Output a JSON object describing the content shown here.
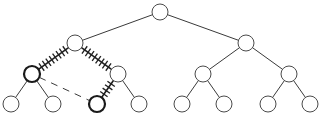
{
  "diagram": {
    "type": "binary-tree",
    "depth": 3,
    "node_radius": 8,
    "colors": {
      "background": "#ffffff",
      "node_stroke": "#4a4a4a",
      "highlight_stroke": "#1a1a1a",
      "edge": "#3a3a3a"
    },
    "nodes": [
      {
        "id": "n0",
        "level": 0,
        "x": 160,
        "y": 12,
        "highlight": false
      },
      {
        "id": "n1",
        "level": 1,
        "x": 75,
        "y": 43,
        "highlight": false
      },
      {
        "id": "n2",
        "level": 1,
        "x": 246,
        "y": 43,
        "highlight": false
      },
      {
        "id": "n3",
        "level": 2,
        "x": 32,
        "y": 74,
        "highlight": true
      },
      {
        "id": "n4",
        "level": 2,
        "x": 118,
        "y": 74,
        "highlight": false
      },
      {
        "id": "n5",
        "level": 2,
        "x": 203,
        "y": 74,
        "highlight": false
      },
      {
        "id": "n6",
        "level": 2,
        "x": 289,
        "y": 74,
        "highlight": false
      },
      {
        "id": "n7",
        "level": 3,
        "x": 11,
        "y": 104,
        "highlight": false
      },
      {
        "id": "n8",
        "level": 3,
        "x": 53,
        "y": 104,
        "highlight": false
      },
      {
        "id": "n9",
        "level": 3,
        "x": 97,
        "y": 104,
        "highlight": true
      },
      {
        "id": "n10",
        "level": 3,
        "x": 139,
        "y": 104,
        "highlight": false
      },
      {
        "id": "n11",
        "level": 3,
        "x": 182,
        "y": 104,
        "highlight": false
      },
      {
        "id": "n12",
        "level": 3,
        "x": 224,
        "y": 104,
        "highlight": false
      },
      {
        "id": "n13",
        "level": 3,
        "x": 268,
        "y": 104,
        "highlight": false
      },
      {
        "id": "n14",
        "level": 3,
        "x": 310,
        "y": 104,
        "highlight": false
      }
    ],
    "edges": [
      {
        "from": "n0",
        "to": "n1",
        "style": "solid"
      },
      {
        "from": "n0",
        "to": "n2",
        "style": "solid"
      },
      {
        "from": "n1",
        "to": "n3",
        "style": "hatched"
      },
      {
        "from": "n1",
        "to": "n4",
        "style": "hatched"
      },
      {
        "from": "n2",
        "to": "n5",
        "style": "solid"
      },
      {
        "from": "n2",
        "to": "n6",
        "style": "solid"
      },
      {
        "from": "n3",
        "to": "n7",
        "style": "solid"
      },
      {
        "from": "n3",
        "to": "n8",
        "style": "solid"
      },
      {
        "from": "n4",
        "to": "n9",
        "style": "hatched"
      },
      {
        "from": "n4",
        "to": "n10",
        "style": "solid"
      },
      {
        "from": "n5",
        "to": "n11",
        "style": "solid"
      },
      {
        "from": "n5",
        "to": "n12",
        "style": "solid"
      },
      {
        "from": "n6",
        "to": "n13",
        "style": "solid"
      },
      {
        "from": "n6",
        "to": "n14",
        "style": "solid"
      },
      {
        "from": "n3",
        "to": "n9",
        "style": "dashed"
      }
    ]
  }
}
